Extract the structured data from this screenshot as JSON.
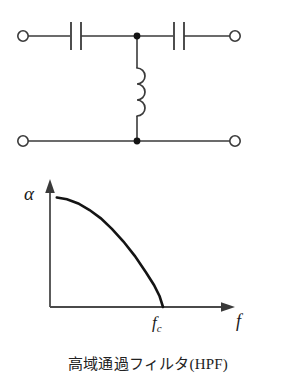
{
  "figure": {
    "caption": "高域通過フィルタ(HPF)",
    "kind": "circuit-schematic-with-response-plot"
  },
  "circuit": {
    "topology": "T-section high-pass ladder",
    "title_hidden": "",
    "terminals": [
      {
        "name": "input-terminal-left",
        "position": "top-left",
        "style": "open-circle"
      },
      {
        "name": "output-terminal-right",
        "position": "top-right",
        "style": "open-circle"
      },
      {
        "name": "input-terminal-left-bottom",
        "position": "bottom-left",
        "style": "open-circle"
      },
      {
        "name": "output-terminal-right-bottom",
        "position": "bottom-right",
        "style": "open-circle"
      }
    ],
    "components": [
      {
        "name": "series-capacitor-left",
        "type": "capacitor",
        "symbol": "two parallel plates",
        "branch": "series-top-left"
      },
      {
        "name": "series-capacitor-right",
        "type": "capacitor",
        "symbol": "two parallel plates",
        "branch": "series-top-right"
      },
      {
        "name": "shunt-inductor",
        "type": "inductor",
        "symbol": "three-arc coil",
        "branch": "shunt-middle"
      }
    ],
    "junctions": [
      {
        "name": "top-node",
        "style": "solid-dot"
      },
      {
        "name": "bottom-node",
        "style": "solid-dot"
      }
    ]
  },
  "chart_data": {
    "type": "line",
    "title": "",
    "xlabel": "f",
    "ylabel": "α",
    "xlim": [
      0,
      1.35
    ],
    "ylim": [
      0,
      1.1
    ],
    "grid": false,
    "legend": null,
    "annotations": [
      {
        "name": "cutoff-frequency",
        "text": "f",
        "subscript": "c",
        "x": 1.0,
        "y": 0.0
      }
    ],
    "axis_arrows": {
      "x": true,
      "y": true
    },
    "series": [
      {
        "name": "attenuation-curve",
        "comment": "attenuation alpha falls from a high plateau to zero at the cutoff frequency fc",
        "x": [
          0.06,
          0.15,
          0.25,
          0.35,
          0.45,
          0.55,
          0.65,
          0.75,
          0.85,
          0.92,
          0.97,
          1.0
        ],
        "y": [
          0.92,
          0.905,
          0.87,
          0.815,
          0.745,
          0.655,
          0.55,
          0.43,
          0.29,
          0.185,
          0.09,
          0.0
        ]
      }
    ]
  },
  "labels": {
    "alpha": "α",
    "f": "f",
    "fc_base": "f",
    "fc_sub": "c"
  },
  "colors": {
    "ink": "#1a1a1a",
    "wire": "#3a3a3a",
    "curve": "#141414",
    "axis": "#4a4a4a",
    "background": "#ffffff"
  }
}
